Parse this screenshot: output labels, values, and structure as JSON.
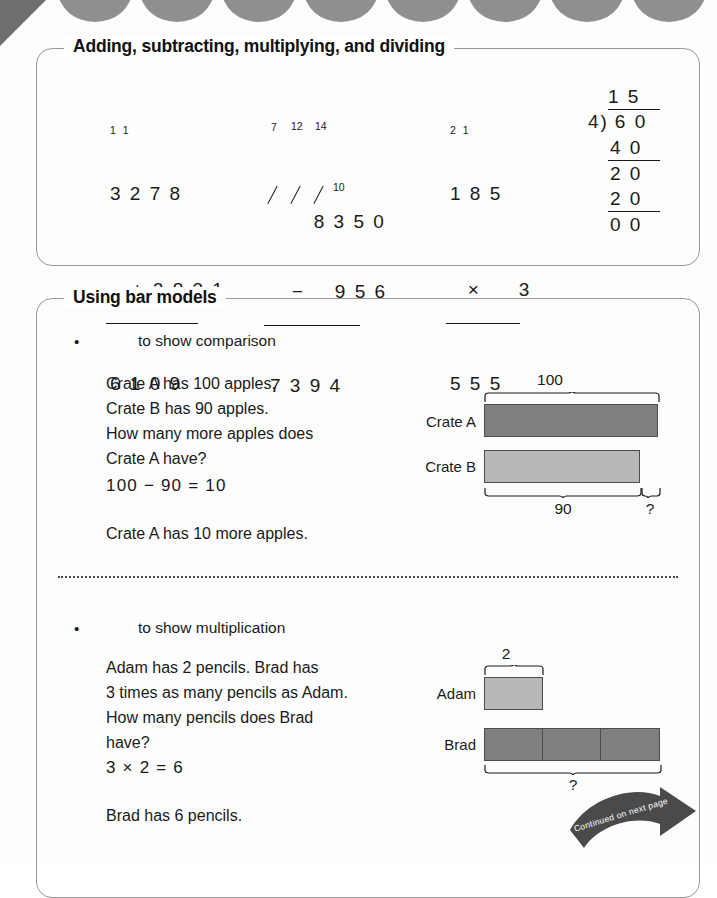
{
  "page": {
    "decor": {
      "scallop_color": "#8f8f8f",
      "corner_color": "#6e6e6e"
    }
  },
  "sections": {
    "operations": {
      "title": "Adding, subtracting, multiplying, and dividing",
      "addition": {
        "carries": "1 1",
        "addend1": "3 2 7 8",
        "operator": "+",
        "addend2": "2 8 3 1",
        "sum": "6 1 0 9"
      },
      "subtraction": {
        "regroup_tens": "7",
        "regroup_hundreds": "12",
        "regroup_thousands": "14",
        "regroup_ones": "10",
        "minuend": "8 3 5 0",
        "operator": "−",
        "subtrahend": "9 5 6",
        "difference": "7 3 9 4"
      },
      "multiplication": {
        "carries": "2 1",
        "factor1": "1 8 5",
        "operator": "×",
        "factor2": "3",
        "product": "5 5 5"
      },
      "division": {
        "quotient": "1 5",
        "divisor": "4",
        "dividend": "6 0",
        "step1": "4 0",
        "step2": "2 0",
        "step3": "2 0",
        "remainder": "0 0"
      }
    },
    "bar_models": {
      "title": "Using bar models",
      "examples": [
        {
          "bullet": "•",
          "heading": "to show comparison",
          "problem": "Crate A has 100 apples.\nCrate B has 90 apples.\nHow many more apples does\nCrate A have?",
          "equation": "100  −  90  =  10",
          "answer": "Crate A has 10 more apples.",
          "diagram": {
            "top_brace_label": "100",
            "bar1_label": "Crate A",
            "bar2_label": "Crate B",
            "bottom_brace_label": "90",
            "difference_label": "?",
            "bar1_color": "#808080",
            "bar2_color": "#b8b8b8"
          }
        },
        {
          "bullet": "•",
          "heading": "to show multiplication",
          "problem": "Adam has 2 pencils. Brad has\n3 times as many pencils as Adam.\nHow many pencils does Brad\nhave?",
          "equation": "3  ×  2  =  6",
          "answer": "Brad has 6 pencils.",
          "diagram": {
            "top_brace_label": "2",
            "bar1_label": "Adam",
            "bar2_label": "Brad",
            "bottom_brace_label": "?",
            "bar2_units": 3,
            "bar1_color": "#b8b8b8",
            "bar2_color": "#808080"
          }
        }
      ]
    }
  },
  "footer": {
    "continued_text": "Continued on next page"
  }
}
